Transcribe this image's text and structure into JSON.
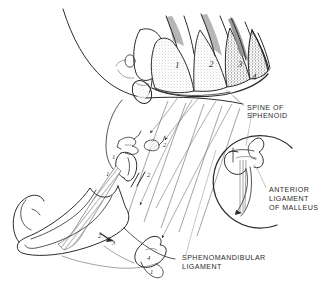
{
  "figure": {
    "ink_color": "#2b2b2b",
    "background": "#ffffff"
  },
  "labels": {
    "spine_of_sphenoid": {
      "line1": "SPINE OF",
      "line2": "SPHENOID"
    },
    "anterior_ligament_of_malleus": {
      "line1": "ANTERIOR",
      "line2": "LIGAMENT",
      "line3": "OF MALLEUS"
    },
    "sphenomandibular_ligament": {
      "line1": "SPHENOMANDIBULAR",
      "line2": "LIGAMENT"
    }
  },
  "arch_numbers": {
    "arch1": "1",
    "arch2": "2",
    "arch3": "3",
    "arch4": "4"
  },
  "derivative_numbers": {
    "ossicle_malleus_incus": "1",
    "ossicle_stapes": "2",
    "styloid_process": "1",
    "ligament_band": "1",
    "bar_arch1": "1",
    "bar_arch2": "2",
    "mandible_angle_a": "2",
    "mandible_angle_b": "3",
    "hyoid_body": "4",
    "hyoid_horn": "1"
  },
  "regions": {
    "pharyngeal_arches": "pharyngeal-arches-group",
    "ear_ossicles": "ear-ossicles-group",
    "mandible": "mandible-outline",
    "hyoid_bone": "hyoid-bone",
    "inset_malleus": "malleus-inset-circle"
  }
}
